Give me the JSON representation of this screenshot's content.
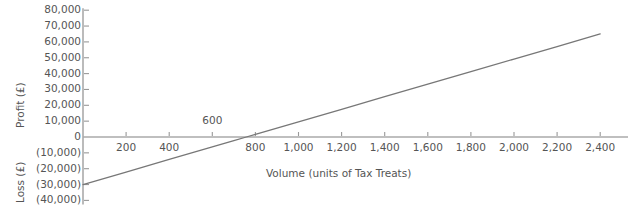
{
  "chart_data": {
    "type": "line",
    "title": "",
    "subtitle": "",
    "xlabel": "Volume (units of Tax Treats)",
    "ylabel_positive": "Profit (£)",
    "ylabel_negative": "Loss (£)",
    "ylabel": "Profit (£) / Loss (£)",
    "grid": false,
    "legend": false,
    "legend_position": "none",
    "xlim": [
      0,
      2500
    ],
    "ylim": [
      -40000,
      80000
    ],
    "x_tick_step": 200,
    "y_tick_step": 10000,
    "x_ticks": [
      {
        "value": 200,
        "label": "200",
        "position": "below"
      },
      {
        "value": 400,
        "label": "400",
        "position": "below"
      },
      {
        "value": 600,
        "label": "600",
        "position": "above"
      },
      {
        "value": 800,
        "label": "800",
        "position": "below"
      },
      {
        "value": 1000,
        "label": "1,000",
        "position": "below"
      },
      {
        "value": 1200,
        "label": "1,200",
        "position": "below"
      },
      {
        "value": 1400,
        "label": "1,400",
        "position": "below"
      },
      {
        "value": 1600,
        "label": "1,600",
        "position": "below"
      },
      {
        "value": 1800,
        "label": "1,800",
        "position": "below"
      },
      {
        "value": 2000,
        "label": "2,000",
        "position": "below"
      },
      {
        "value": 2200,
        "label": "2,200",
        "position": "below"
      },
      {
        "value": 2400,
        "label": "2,400",
        "position": "below"
      }
    ],
    "y_ticks": [
      {
        "value": 80000,
        "label": "80,000"
      },
      {
        "value": 70000,
        "label": "70,000"
      },
      {
        "value": 60000,
        "label": "60,000"
      },
      {
        "value": 50000,
        "label": "50,000"
      },
      {
        "value": 40000,
        "label": "40,000"
      },
      {
        "value": 30000,
        "label": "30,000"
      },
      {
        "value": 20000,
        "label": "20,000"
      },
      {
        "value": 10000,
        "label": "10,000"
      },
      {
        "value": 0,
        "label": "0"
      },
      {
        "value": -10000,
        "label": "(10,000)"
      },
      {
        "value": -20000,
        "label": "(20,000)"
      },
      {
        "value": -30000,
        "label": "(30,000)"
      },
      {
        "value": -40000,
        "label": "(40,000)"
      }
    ],
    "series": [
      {
        "name": "Profit",
        "color": "#777777",
        "x": [
          0,
          2400
        ],
        "values": [
          -30000,
          65000
        ],
        "points": [
          {
            "x": 0,
            "y": -30000
          },
          {
            "x": 200,
            "y": -22083
          },
          {
            "x": 400,
            "y": -14167
          },
          {
            "x": 600,
            "y": -6250
          },
          {
            "x": 700,
            "y": -2292
          },
          {
            "x": 758,
            "y": 0
          },
          {
            "x": 800,
            "y": 1667
          },
          {
            "x": 1000,
            "y": 9583
          },
          {
            "x": 1200,
            "y": 17500
          },
          {
            "x": 1400,
            "y": 25417
          },
          {
            "x": 1600,
            "y": 33333
          },
          {
            "x": 1800,
            "y": 41250
          },
          {
            "x": 2000,
            "y": 49167
          },
          {
            "x": 2200,
            "y": 57083
          },
          {
            "x": 2400,
            "y": 65000
          }
        ]
      }
    ],
    "colors": {
      "line": "#777777",
      "axis": "#aaaaaa",
      "tick": "#999999",
      "text": "#555555",
      "background": "#ffffff"
    }
  }
}
